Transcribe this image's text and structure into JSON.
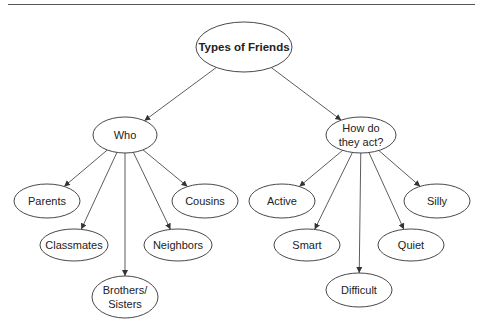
{
  "diagram": {
    "type": "concept-map",
    "root": {
      "id": "root",
      "label": "Types of Friends"
    },
    "nodes": [
      {
        "id": "root",
        "lines": [
          "Types of Friends"
        ],
        "cx": 244,
        "cy": 47,
        "rx": 48,
        "ry": 25,
        "bold": true
      },
      {
        "id": "who",
        "lines": [
          "Who"
        ],
        "cx": 125,
        "cy": 135,
        "rx": 32,
        "ry": 18
      },
      {
        "id": "how",
        "lines": [
          "How do",
          "they act?"
        ],
        "cx": 361,
        "cy": 135,
        "rx": 35,
        "ry": 18
      },
      {
        "id": "parents",
        "lines": [
          "Parents"
        ],
        "cx": 47,
        "cy": 201,
        "rx": 33,
        "ry": 17
      },
      {
        "id": "cousins",
        "lines": [
          "Cousins"
        ],
        "cx": 205,
        "cy": 201,
        "rx": 33,
        "ry": 17
      },
      {
        "id": "classmates",
        "lines": [
          "Classmates"
        ],
        "cx": 74,
        "cy": 245,
        "rx": 34,
        "ry": 16
      },
      {
        "id": "neighbors",
        "lines": [
          "Neighbors"
        ],
        "cx": 178,
        "cy": 245,
        "rx": 34,
        "ry": 16
      },
      {
        "id": "siblings",
        "lines": [
          "Brothers/",
          "Sisters"
        ],
        "cx": 125,
        "cy": 297,
        "rx": 33,
        "ry": 21
      },
      {
        "id": "active",
        "lines": [
          "Active"
        ],
        "cx": 282,
        "cy": 201,
        "rx": 33,
        "ry": 17
      },
      {
        "id": "silly",
        "lines": [
          "Silly"
        ],
        "cx": 437,
        "cy": 201,
        "rx": 33,
        "ry": 17
      },
      {
        "id": "smart",
        "lines": [
          "Smart"
        ],
        "cx": 307,
        "cy": 245,
        "rx": 33,
        "ry": 16
      },
      {
        "id": "quiet",
        "lines": [
          "Quiet"
        ],
        "cx": 411,
        "cy": 245,
        "rx": 33,
        "ry": 16
      },
      {
        "id": "difficult",
        "lines": [
          "Difficult"
        ],
        "cx": 359,
        "cy": 290,
        "rx": 33,
        "ry": 17
      }
    ],
    "edges": [
      {
        "from": "root",
        "to": "who"
      },
      {
        "from": "root",
        "to": "how"
      },
      {
        "from": "who",
        "to": "parents"
      },
      {
        "from": "who",
        "to": "classmates"
      },
      {
        "from": "who",
        "to": "siblings"
      },
      {
        "from": "who",
        "to": "neighbors"
      },
      {
        "from": "who",
        "to": "cousins"
      },
      {
        "from": "how",
        "to": "active"
      },
      {
        "from": "how",
        "to": "smart"
      },
      {
        "from": "how",
        "to": "difficult"
      },
      {
        "from": "how",
        "to": "quiet"
      },
      {
        "from": "how",
        "to": "silly"
      }
    ],
    "colors": {
      "stroke": "#333333",
      "fill": "#ffffff",
      "text": "#222222"
    }
  }
}
